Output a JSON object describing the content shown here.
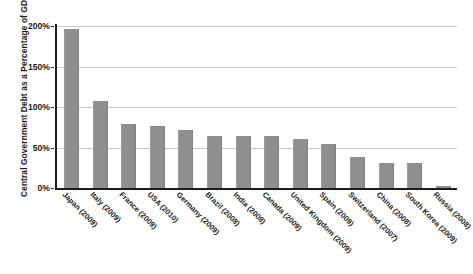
{
  "chart_data": {
    "type": "bar",
    "title": "",
    "xlabel": "",
    "ylabel": "Central Government Debt as a Percentage of GDP",
    "ylim": [
      0,
      200
    ],
    "yunit": "%",
    "grid": true,
    "legend": "none",
    "orientation": "vertical",
    "bar_color": "#8f8f8f",
    "categories": [
      "Japan (2009)",
      "Italy (2009)",
      "France (2009)",
      "USA (2010)",
      "Germany (2009)",
      "Brazil (2008)",
      "India (2008)",
      "Canada (2009)",
      "United Kingdom (2009)",
      "Spain (2009)",
      "Switzerland (2007)",
      "China (2008)",
      "South Korea (2009)",
      "Russia (2008)"
    ],
    "values": [
      196,
      108,
      79,
      77,
      72,
      64,
      64,
      64,
      61,
      54,
      38,
      31,
      31,
      3
    ],
    "yticks": [
      0,
      50,
      100,
      150,
      200
    ],
    "ytick_labels": [
      "0%",
      "50%",
      "100%",
      "150%",
      "200%"
    ]
  }
}
